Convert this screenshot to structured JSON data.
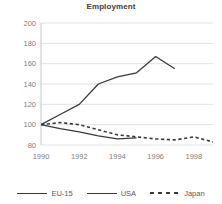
{
  "chart_data": {
    "type": "line",
    "title": "Employment",
    "xlabel": "",
    "ylabel": "",
    "xlim": [
      1990,
      1999
    ],
    "ylim": [
      80,
      200
    ],
    "yticks": [
      80,
      100,
      120,
      140,
      160,
      180,
      200
    ],
    "xticks": [
      1990,
      1992,
      1994,
      1996,
      1998
    ],
    "grid": "horizontal",
    "legend_position": "bottom",
    "series": [
      {
        "name": "EU-15",
        "style": "solid",
        "color": "#3a3a3a",
        "x": [
          1990,
          1991,
          1992,
          1993,
          1994,
          1995
        ],
        "values": [
          100,
          96,
          93,
          89,
          86,
          87
        ]
      },
      {
        "name": "USA",
        "style": "solid",
        "color": "#3a3a3a",
        "x": [
          1990,
          1991,
          1992,
          1993,
          1994,
          1995,
          1996,
          1997
        ],
        "values": [
          100,
          110,
          120,
          140,
          147,
          151,
          167,
          155
        ]
      },
      {
        "name": "Japan",
        "style": "dashed",
        "color": "#3a3a3a",
        "x": [
          1990,
          1991,
          1992,
          1993,
          1994,
          1995,
          1996,
          1997,
          1998,
          1999
        ],
        "values": [
          100,
          102,
          100,
          95,
          90,
          88,
          86,
          85,
          88,
          83
        ]
      }
    ]
  },
  "legend": {
    "items": [
      {
        "label": "EU-15",
        "swatch": "solid-line-swatch"
      },
      {
        "label": "USA",
        "swatch": "solid-line-swatch"
      },
      {
        "label": "Japan",
        "swatch": "dashed-line-swatch"
      }
    ]
  }
}
